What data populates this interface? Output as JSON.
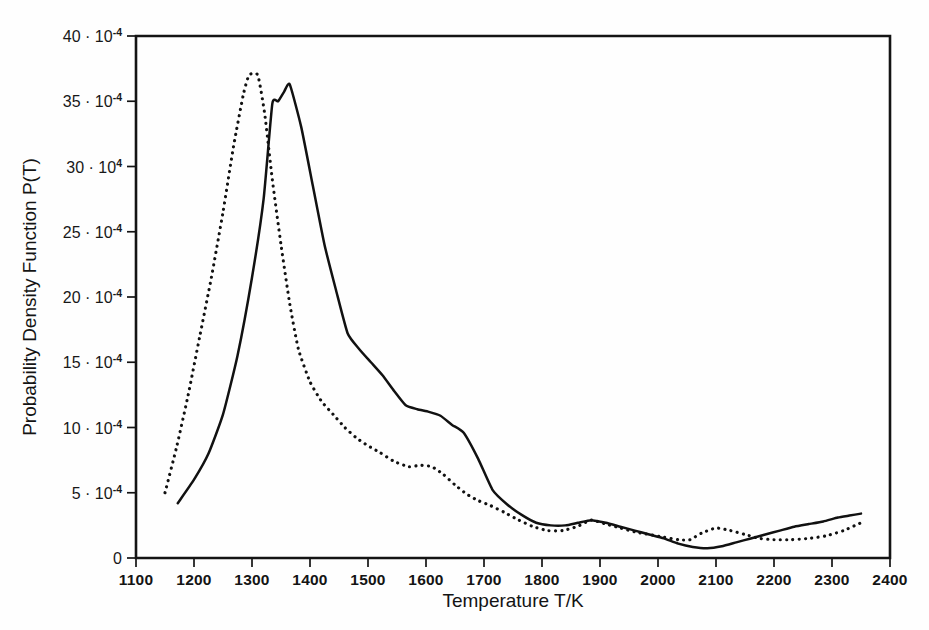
{
  "figure": {
    "kind": "scanned-scientific-plot",
    "background_color": "#fefefe",
    "ink_color": "#111111"
  },
  "axis": {
    "x_title": "Temperature T/K",
    "y_title": "Probability Density Function P(T)",
    "x_tick_labels": [
      "1100",
      "1200",
      "1300",
      "1400",
      "1500",
      "1600",
      "1700",
      "1800",
      "1900",
      "2000",
      "2100",
      "2200",
      "2300",
      "2400"
    ],
    "y_tick_labels": [
      {
        "mantissa": "0",
        "sep": "",
        "base": "",
        "exp": ""
      },
      {
        "mantissa": "5",
        "sep": " · ",
        "base": "10",
        "exp": "-4"
      },
      {
        "mantissa": "10",
        "sep": " · ",
        "base": "10",
        "exp": "-4"
      },
      {
        "mantissa": "15",
        "sep": " · ",
        "base": "10",
        "exp": "-4"
      },
      {
        "mantissa": "20",
        "sep": " · ",
        "base": "10",
        "exp": "-4"
      },
      {
        "mantissa": "25",
        "sep": " · ",
        "base": "10",
        "exp": "-4"
      },
      {
        "mantissa": "30",
        "sep": " · ",
        "base": "10",
        "exp": "4"
      },
      {
        "mantissa": "35",
        "sep": " · ",
        "base": "10",
        "exp": "-4"
      },
      {
        "mantissa": "40",
        "sep": " · ",
        "base": "10",
        "exp": "-4"
      }
    ]
  },
  "chart_data": {
    "type": "line",
    "title": "",
    "subtitle": "",
    "xlabel": "Temperature T/K",
    "ylabel": "Probability Density Function P(T)",
    "xlim": [
      1100,
      2400
    ],
    "ylim": [
      0,
      40
    ],
    "y_unit_scale": "1e-4",
    "y_tick_values": [
      0,
      5,
      10,
      15,
      20,
      25,
      30,
      35,
      40
    ],
    "x_tick_values": [
      1100,
      1200,
      1300,
      1400,
      1500,
      1600,
      1700,
      1800,
      1900,
      2000,
      2100,
      2200,
      2300,
      2400
    ],
    "x_minor_tick_step": 100,
    "grid": false,
    "legend": false,
    "legend_position": "none",
    "annotations": [
      "y tick at 30 is printed as '30 · 10 4' — minus sign of the exponent is missing in the scan"
    ],
    "series": [
      {
        "name": "solid-curve",
        "style": "solid",
        "color": "#111111",
        "points": [
          [
            1172,
            4.2
          ],
          [
            1200,
            6.0
          ],
          [
            1225,
            8.0
          ],
          [
            1250,
            11.0
          ],
          [
            1275,
            15.5
          ],
          [
            1300,
            21.5
          ],
          [
            1320,
            27.5
          ],
          [
            1335,
            34.8
          ],
          [
            1345,
            35.0
          ],
          [
            1355,
            35.7
          ],
          [
            1365,
            36.3
          ],
          [
            1385,
            33.0
          ],
          [
            1405,
            28.5
          ],
          [
            1425,
            24.0
          ],
          [
            1445,
            20.5
          ],
          [
            1465,
            17.2
          ],
          [
            1485,
            16.0
          ],
          [
            1505,
            15.0
          ],
          [
            1525,
            14.0
          ],
          [
            1545,
            12.8
          ],
          [
            1565,
            11.7
          ],
          [
            1585,
            11.4
          ],
          [
            1605,
            11.2
          ],
          [
            1625,
            10.9
          ],
          [
            1645,
            10.2
          ],
          [
            1665,
            9.6
          ],
          [
            1690,
            7.6
          ],
          [
            1715,
            5.2
          ],
          [
            1740,
            4.1
          ],
          [
            1765,
            3.3
          ],
          [
            1790,
            2.7
          ],
          [
            1815,
            2.5
          ],
          [
            1840,
            2.5
          ],
          [
            1862,
            2.7
          ],
          [
            1885,
            2.9
          ],
          [
            1910,
            2.7
          ],
          [
            1935,
            2.4
          ],
          [
            1960,
            2.1
          ],
          [
            1985,
            1.8
          ],
          [
            2010,
            1.5
          ],
          [
            2035,
            1.1
          ],
          [
            2060,
            0.85
          ],
          [
            2085,
            0.75
          ],
          [
            2110,
            0.9
          ],
          [
            2135,
            1.2
          ],
          [
            2160,
            1.5
          ],
          [
            2185,
            1.8
          ],
          [
            2210,
            2.1
          ],
          [
            2235,
            2.4
          ],
          [
            2260,
            2.6
          ],
          [
            2285,
            2.8
          ],
          [
            2310,
            3.1
          ],
          [
            2330,
            3.25
          ],
          [
            2350,
            3.4
          ]
        ]
      },
      {
        "name": "dotted-curve",
        "style": "dotted",
        "color": "#111111",
        "points": [
          [
            1150,
            5.0
          ],
          [
            1170,
            8.5
          ],
          [
            1190,
            12.5
          ],
          [
            1210,
            17.0
          ],
          [
            1230,
            21.5
          ],
          [
            1250,
            26.5
          ],
          [
            1268,
            31.5
          ],
          [
            1285,
            35.5
          ],
          [
            1295,
            37.0
          ],
          [
            1310,
            37.0
          ],
          [
            1322,
            34.0
          ],
          [
            1335,
            29.0
          ],
          [
            1350,
            24.0
          ],
          [
            1365,
            19.5
          ],
          [
            1380,
            16.0
          ],
          [
            1400,
            13.5
          ],
          [
            1420,
            12.0
          ],
          [
            1440,
            11.0
          ],
          [
            1460,
            10.0
          ],
          [
            1480,
            9.2
          ],
          [
            1500,
            8.6
          ],
          [
            1520,
            8.1
          ],
          [
            1545,
            7.4
          ],
          [
            1570,
            7.0
          ],
          [
            1590,
            7.1
          ],
          [
            1610,
            7.0
          ],
          [
            1630,
            6.4
          ],
          [
            1650,
            5.6
          ],
          [
            1670,
            4.9
          ],
          [
            1690,
            4.4
          ],
          [
            1712,
            4.0
          ],
          [
            1735,
            3.5
          ],
          [
            1760,
            2.9
          ],
          [
            1785,
            2.4
          ],
          [
            1810,
            2.1
          ],
          [
            1835,
            2.1
          ],
          [
            1860,
            2.4
          ],
          [
            1885,
            2.9
          ],
          [
            1910,
            2.6
          ],
          [
            1935,
            2.3
          ],
          [
            1960,
            2.0
          ],
          [
            1985,
            1.8
          ],
          [
            2010,
            1.6
          ],
          [
            2035,
            1.4
          ],
          [
            2055,
            1.4
          ],
          [
            2075,
            1.9
          ],
          [
            2100,
            2.3
          ],
          [
            2125,
            2.1
          ],
          [
            2150,
            1.8
          ],
          [
            2175,
            1.5
          ],
          [
            2200,
            1.4
          ],
          [
            2230,
            1.4
          ],
          [
            2260,
            1.5
          ],
          [
            2290,
            1.7
          ],
          [
            2320,
            2.1
          ],
          [
            2350,
            2.7
          ]
        ]
      }
    ]
  }
}
